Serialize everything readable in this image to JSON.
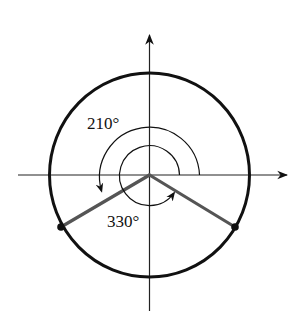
{
  "diagram": {
    "type": "coterminal-angle-unit-circle",
    "labels": {
      "outer_angle": "210°",
      "inner_angle": "330°"
    },
    "angles_deg": [
      210,
      330
    ],
    "colors": {
      "circle": "#111111",
      "axes": "#222222",
      "terminal_rays": "#555555",
      "arcs": "#111111",
      "points": "#111111"
    },
    "geometry": {
      "center": [
        149.5,
        175
      ],
      "circle_radius": 101,
      "outer_arc_radius": 50,
      "inner_arc_radius": 30,
      "x_axis": [
        18,
        289
      ],
      "y_axis": [
        33,
        311
      ]
    }
  }
}
